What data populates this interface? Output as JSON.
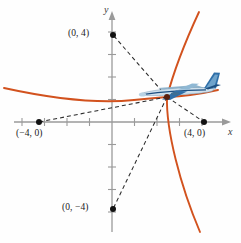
{
  "figure": {
    "axes": {
      "x_label": "x",
      "y_label": "y",
      "origin_px": [
        112,
        122
      ],
      "unit_px": 22.5,
      "tick_marks": true,
      "axis_color": "#9a9a9a",
      "arrowheads": true
    },
    "points": [
      {
        "name": "point-0-4",
        "label": "(0, 4)",
        "x": 0,
        "y": 4,
        "px": [
          112,
          35
        ],
        "label_px": [
          70,
          29
        ]
      },
      {
        "name": "point-0-neg4",
        "label": "(0, −4)",
        "x": 0,
        "y": -4,
        "px": [
          112,
          209
        ],
        "label_px": [
          64,
          203
        ]
      },
      {
        "name": "point-neg4-0",
        "label": "(−4, 0)",
        "x": -4,
        "y": 0,
        "px": [
          38,
          122
        ],
        "label_px": [
          18,
          129
        ]
      },
      {
        "name": "point-4-0",
        "label": "(4, 0)",
        "x": 4,
        "y": 0,
        "px": [
          205,
          122
        ],
        "label_px": [
          186,
          129
        ]
      }
    ],
    "focus_point": {
      "name": "intersection-point",
      "px": [
        167,
        97
      ]
    },
    "curve": {
      "color": "#d2521e",
      "kind": "hyperbola-branches",
      "stroke_width": 1.8
    },
    "dashed_lines": {
      "color": "#2a2a2a",
      "dash": "4 3",
      "count": 4
    },
    "airplane": {
      "name": "airplane-icon",
      "px": [
        180,
        92
      ],
      "heading": "right",
      "body_color": "#b9d3e4",
      "accent_color": "#2f6fa8",
      "trim_color": "#1d4f80"
    }
  }
}
